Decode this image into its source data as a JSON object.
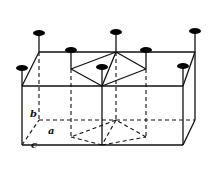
{
  "figure": {
    "labels": {
      "a": "a",
      "b": "b",
      "c": "c"
    },
    "colors": {
      "line": "#111111",
      "atom": "#000000",
      "background": "#ffffff"
    },
    "atom_count_visible": 8
  }
}
